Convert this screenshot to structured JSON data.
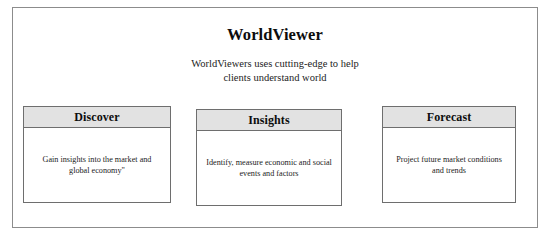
{
  "header": {
    "title": "WorldViewer",
    "subtitle_line1": "WorldViewers uses cutting-edge to help",
    "subtitle_line2": "clients understand world"
  },
  "cards": [
    {
      "title": "Discover",
      "body": "Gain insights into the market and global economy\""
    },
    {
      "title": "Insights",
      "body": "Identify, measure economic and social events and factors"
    },
    {
      "title": "Forecast",
      "body": "Project future market conditions and trends"
    }
  ],
  "colors": {
    "frame_border": "#8c8c8c",
    "card_border": "#6e6e6e",
    "card_header_bg": "#e2e2e2",
    "text": "#1c1c1c",
    "background": "#ffffff"
  }
}
